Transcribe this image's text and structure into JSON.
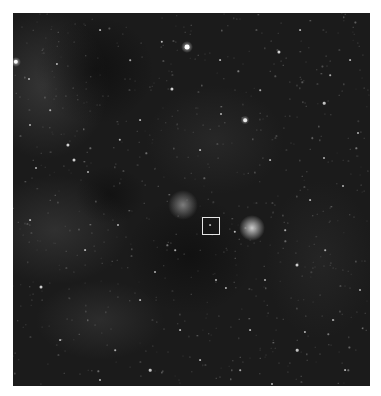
{
  "image": {
    "frame": {
      "x": 13,
      "y": 13,
      "width": 357,
      "height": 373
    },
    "background_color": "#1b1b1b",
    "page_background": "#ffffff"
  },
  "nebula_regions": [
    {
      "name": "diffuse-cloud-upper-left",
      "x": 45,
      "y": 85,
      "w": 130,
      "h": 150,
      "color": "rgba(120,120,120,0.28)"
    },
    {
      "name": "diffuse-cloud-left-mid",
      "x": 55,
      "y": 230,
      "w": 150,
      "h": 110,
      "color": "rgba(110,110,110,0.25)"
    },
    {
      "name": "diffuse-cloud-lower",
      "x": 100,
      "y": 320,
      "w": 130,
      "h": 80,
      "color": "rgba(105,105,105,0.22)"
    },
    {
      "name": "diffuse-cloud-center",
      "x": 215,
      "y": 140,
      "w": 140,
      "h": 110,
      "color": "rgba(95,95,95,0.18)"
    },
    {
      "name": "diffuse-cloud-right",
      "x": 320,
      "y": 260,
      "w": 110,
      "h": 160,
      "color": "rgba(90,90,90,0.15)"
    }
  ],
  "dark_regions": [
    {
      "name": "dark-cloud-top",
      "x": 95,
      "y": 70,
      "w": 120,
      "h": 110,
      "color": "rgba(8,8,8,0.55)"
    },
    {
      "name": "dark-cloud-center",
      "x": 190,
      "y": 255,
      "w": 130,
      "h": 120,
      "color": "rgba(8,8,8,0.5)"
    },
    {
      "name": "dark-cloud-mid-left",
      "x": 110,
      "y": 195,
      "w": 70,
      "h": 60,
      "color": "rgba(8,8,8,0.45)"
    }
  ],
  "glows": [
    {
      "name": "bright-star-glow",
      "x": 252,
      "y": 228,
      "size": 26,
      "color": "rgba(235,235,235,0.85)"
    },
    {
      "name": "nebula-glow",
      "x": 183,
      "y": 205,
      "size": 30,
      "color": "rgba(190,190,190,0.6)"
    },
    {
      "name": "star-glow-top",
      "x": 187,
      "y": 47,
      "size": 12,
      "color": "rgba(230,230,230,0.7)"
    },
    {
      "name": "star-glow-left",
      "x": 16,
      "y": 62,
      "size": 10,
      "color": "rgba(230,230,230,0.7)"
    },
    {
      "name": "star-glow-right",
      "x": 245,
      "y": 120,
      "size": 9,
      "color": "rgba(220,220,220,0.6)"
    }
  ],
  "stars": [
    {
      "x": 187,
      "y": 47,
      "r": 2.4
    },
    {
      "x": 16,
      "y": 62,
      "r": 2.2
    },
    {
      "x": 279,
      "y": 52,
      "r": 1.6
    },
    {
      "x": 172,
      "y": 89,
      "r": 1.6
    },
    {
      "x": 245,
      "y": 120,
      "r": 1.8
    },
    {
      "x": 162,
      "y": 42,
      "r": 1.2
    },
    {
      "x": 324,
      "y": 103,
      "r": 1.3
    },
    {
      "x": 68,
      "y": 145,
      "r": 1.6
    },
    {
      "x": 74,
      "y": 160,
      "r": 1.5
    },
    {
      "x": 120,
      "y": 140,
      "r": 1.2
    },
    {
      "x": 57,
      "y": 64,
      "r": 1.1
    },
    {
      "x": 29,
      "y": 79,
      "r": 1.0
    },
    {
      "x": 30,
      "y": 125,
      "r": 1.0
    },
    {
      "x": 221,
      "y": 114,
      "r": 1.0
    },
    {
      "x": 358,
      "y": 133,
      "r": 1.0
    },
    {
      "x": 41,
      "y": 287,
      "r": 1.5
    },
    {
      "x": 297,
      "y": 265,
      "r": 1.5
    },
    {
      "x": 297,
      "y": 350,
      "r": 1.3
    },
    {
      "x": 305,
      "y": 332,
      "r": 1.1
    },
    {
      "x": 226,
      "y": 288,
      "r": 1.1
    },
    {
      "x": 272,
      "y": 384,
      "r": 1.0
    },
    {
      "x": 333,
      "y": 320,
      "r": 1.0
    },
    {
      "x": 216,
      "y": 280,
      "r": 1.0
    },
    {
      "x": 235,
      "y": 232,
      "r": 1.2
    },
    {
      "x": 155,
      "y": 272,
      "r": 1.0
    },
    {
      "x": 150,
      "y": 370,
      "r": 1.3
    },
    {
      "x": 100,
      "y": 380,
      "r": 1.0
    },
    {
      "x": 360,
      "y": 290,
      "r": 1.0
    },
    {
      "x": 343,
      "y": 186,
      "r": 1.0
    },
    {
      "x": 324,
      "y": 158,
      "r": 1.0
    },
    {
      "x": 265,
      "y": 280,
      "r": 1.0
    },
    {
      "x": 210,
      "y": 225,
      "r": 0.9
    },
    {
      "x": 118,
      "y": 225,
      "r": 1.0
    },
    {
      "x": 88,
      "y": 172,
      "r": 1.0
    },
    {
      "x": 36,
      "y": 168,
      "r": 1.0
    },
    {
      "x": 250,
      "y": 330,
      "r": 0.9
    },
    {
      "x": 180,
      "y": 330,
      "r": 0.9
    },
    {
      "x": 60,
      "y": 340,
      "r": 0.9
    },
    {
      "x": 140,
      "y": 300,
      "r": 0.9
    },
    {
      "x": 350,
      "y": 60,
      "r": 0.9
    },
    {
      "x": 300,
      "y": 30,
      "r": 0.9
    },
    {
      "x": 220,
      "y": 60,
      "r": 0.9
    },
    {
      "x": 100,
      "y": 30,
      "r": 0.9
    },
    {
      "x": 310,
      "y": 200,
      "r": 0.9
    },
    {
      "x": 200,
      "y": 150,
      "r": 0.9
    },
    {
      "x": 270,
      "y": 160,
      "r": 0.9
    },
    {
      "x": 140,
      "y": 120,
      "r": 0.9
    },
    {
      "x": 85,
      "y": 250,
      "r": 0.9
    },
    {
      "x": 30,
      "y": 220,
      "r": 0.9
    },
    {
      "x": 345,
      "y": 370,
      "r": 0.9
    },
    {
      "x": 200,
      "y": 360,
      "r": 0.9
    },
    {
      "x": 115,
      "y": 350,
      "r": 0.8
    },
    {
      "x": 240,
      "y": 370,
      "r": 0.8
    },
    {
      "x": 285,
      "y": 230,
      "r": 0.8
    },
    {
      "x": 325,
      "y": 250,
      "r": 0.8
    },
    {
      "x": 175,
      "y": 250,
      "r": 0.8
    },
    {
      "x": 260,
      "y": 90,
      "r": 0.8
    },
    {
      "x": 330,
      "y": 75,
      "r": 0.8
    },
    {
      "x": 50,
      "y": 110,
      "r": 0.8
    },
    {
      "x": 130,
      "y": 60,
      "r": 0.8
    }
  ],
  "selection_box": {
    "x": 202,
    "y": 217,
    "width": 18,
    "height": 18,
    "color": "#e6e6e6"
  }
}
